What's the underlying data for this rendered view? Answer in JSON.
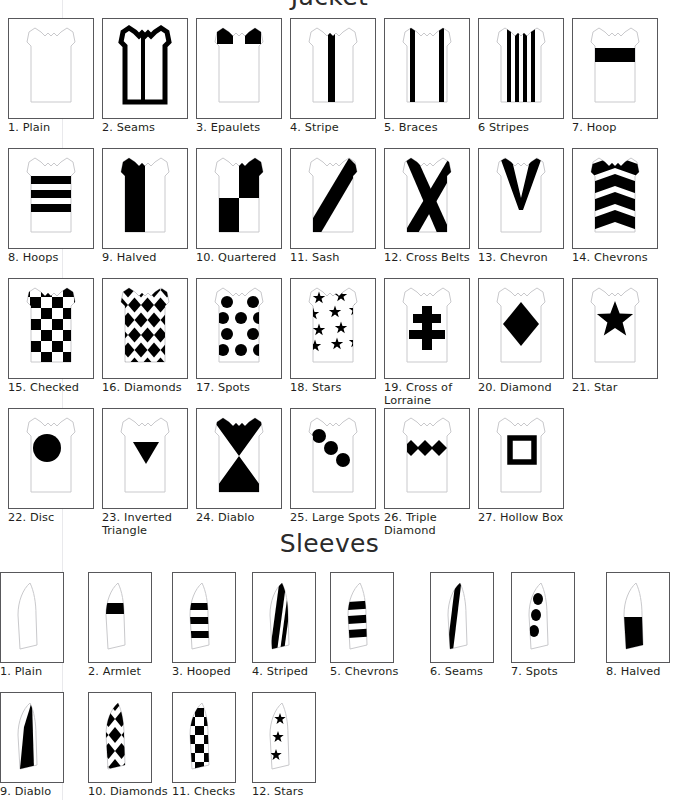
{
  "sections": [
    {
      "id": "jacket",
      "title": "Jacket",
      "items": [
        {
          "n": "1.",
          "label": "1. Plain",
          "name": "Plain",
          "pattern": "plain"
        },
        {
          "n": "2.",
          "label": "2. Seams",
          "name": "Seams",
          "pattern": "seams"
        },
        {
          "n": "3.",
          "label": "3. Epaulets",
          "name": "Epaulets",
          "pattern": "epaulets"
        },
        {
          "n": "4.",
          "label": "4. Stripe",
          "name": "Stripe",
          "pattern": "stripe"
        },
        {
          "n": "5.",
          "label": "5. Braces",
          "name": "Braces",
          "pattern": "braces"
        },
        {
          "n": "6",
          "label": "6 Stripes",
          "name": "Stripes",
          "pattern": "stripes"
        },
        {
          "n": "7.",
          "label": "7. Hoop",
          "name": "Hoop",
          "pattern": "hoop"
        },
        {
          "n": "8.",
          "label": "8. Hoops",
          "name": "Hoops",
          "pattern": "hoops"
        },
        {
          "n": "9.",
          "label": "9. Halved",
          "name": "Halved",
          "pattern": "halved"
        },
        {
          "n": "10.",
          "label": "10. Quartered",
          "name": "Quartered",
          "pattern": "quartered"
        },
        {
          "n": "11.",
          "label": "11. Sash",
          "name": "Sash",
          "pattern": "sash"
        },
        {
          "n": "12.",
          "label": "12. Cross Belts",
          "name": "Cross Belts",
          "pattern": "cross-belts"
        },
        {
          "n": "13.",
          "label": "13. Chevron",
          "name": "Chevron",
          "pattern": "chevron"
        },
        {
          "n": "14.",
          "label": "14. Chevrons",
          "name": "Chevrons",
          "pattern": "chevrons"
        },
        {
          "n": "15.",
          "label": "15. Checked",
          "name": "Checked",
          "pattern": "checked"
        },
        {
          "n": "16.",
          "label": "16. Diamonds",
          "name": "Diamonds",
          "pattern": "diamonds"
        },
        {
          "n": "17.",
          "label": "17. Spots",
          "name": "Spots",
          "pattern": "spots"
        },
        {
          "n": "18.",
          "label": "18. Stars",
          "name": "Stars",
          "pattern": "stars"
        },
        {
          "n": "19.",
          "label": "19. Cross of\nLorraine",
          "name": "Cross of Lorraine",
          "pattern": "cross-of-lorraine"
        },
        {
          "n": "20.",
          "label": "20. Diamond",
          "name": "Diamond",
          "pattern": "diamond"
        },
        {
          "n": "21.",
          "label": "21. Star",
          "name": "Star",
          "pattern": "star"
        },
        {
          "n": "22.",
          "label": "22. Disc",
          "name": "Disc",
          "pattern": "disc"
        },
        {
          "n": "23.",
          "label": "23. Inverted\nTriangle",
          "name": "Inverted Triangle",
          "pattern": "inverted-triangle"
        },
        {
          "n": "24.",
          "label": "24. Diablo",
          "name": "Diablo",
          "pattern": "diablo"
        },
        {
          "n": "25.",
          "label": "25. Large Spots",
          "name": "Large Spots",
          "pattern": "large-spots"
        },
        {
          "n": "26.",
          "label": "26. Triple\nDiamond",
          "name": "Triple Diamond",
          "pattern": "triple-diamond"
        },
        {
          "n": "27.",
          "label": "27. Hollow Box",
          "name": "Hollow Box",
          "pattern": "hollow-box"
        }
      ]
    },
    {
      "id": "sleeves",
      "title": "Sleeves",
      "items": [
        {
          "n": "1.",
          "label": "1. Plain",
          "name": "Plain",
          "pattern": "s-plain"
        },
        {
          "n": "2.",
          "label": "2. Armlet",
          "name": "Armlet",
          "pattern": "s-armlet"
        },
        {
          "n": "3.",
          "label": "3. Hooped",
          "name": "Hooped",
          "pattern": "s-hooped"
        },
        {
          "n": "4.",
          "label": "4. Striped",
          "name": "Striped",
          "pattern": "s-striped"
        },
        {
          "n": "5.",
          "label": "5. Chevrons",
          "name": "Chevrons",
          "pattern": "s-chevrons"
        },
        {
          "n": "6.",
          "label": "6. Seams",
          "name": "Seams",
          "pattern": "s-seams"
        },
        {
          "n": "7.",
          "label": "7. Spots",
          "name": "Spots",
          "pattern": "s-spots"
        },
        {
          "n": "8.",
          "label": "8. Halved",
          "name": "Halved",
          "pattern": "s-halved"
        },
        {
          "n": "9.",
          "label": "9. Diablo",
          "name": "Diablo",
          "pattern": "s-diablo"
        },
        {
          "n": "10.",
          "label": "10. Diamonds",
          "name": "Diamonds",
          "pattern": "s-diamonds"
        },
        {
          "n": "11.",
          "label": "11. Checks",
          "name": "Checks",
          "pattern": "s-checks"
        },
        {
          "n": "12.",
          "label": "12. Stars",
          "name": "Stars",
          "pattern": "s-stars"
        }
      ]
    }
  ],
  "colors": {
    "ink": "#000000",
    "outline": "#c9c9cc",
    "frame": "#58585b",
    "text": "#231f20",
    "background": "#ffffff"
  },
  "layout": {
    "jacket_columns": 7,
    "jacket_rows": 4,
    "sleeve_columns": 8,
    "sleeve_rows": 2
  }
}
